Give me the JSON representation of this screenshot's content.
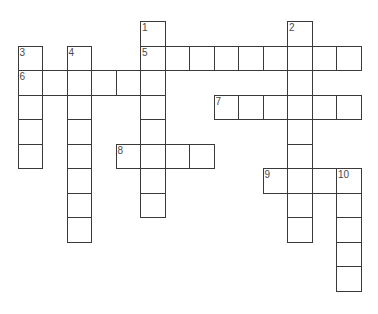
{
  "puzzle": {
    "type": "crossword",
    "grid": {
      "origin_x": 18,
      "origin_y": 21.5,
      "cell_size": 24.5,
      "line_color": "#3a3a3a",
      "number_color": "#4a4a4a"
    },
    "entries": [
      {
        "number": "1",
        "direction": "down",
        "row": 0,
        "col": 5,
        "length": 8
      },
      {
        "number": "2",
        "direction": "down",
        "row": 0,
        "col": 11,
        "length": 9
      },
      {
        "number": "3",
        "direction": "down",
        "row": 1,
        "col": 0,
        "length": 5
      },
      {
        "number": "4",
        "direction": "down",
        "row": 1,
        "col": 2,
        "length": 8
      },
      {
        "number": "5",
        "direction": "across",
        "row": 1,
        "col": 5,
        "length": 9
      },
      {
        "number": "6",
        "direction": "across",
        "row": 2,
        "col": 0,
        "length": 6
      },
      {
        "number": "7",
        "direction": "across",
        "row": 3,
        "col": 8,
        "length": 6
      },
      {
        "number": "8",
        "direction": "across",
        "row": 5,
        "col": 4,
        "length": 4
      },
      {
        "number": "9",
        "direction": "across",
        "row": 6,
        "col": 10,
        "length": 4
      },
      {
        "number": "10",
        "direction": "down",
        "row": 6,
        "col": 13,
        "length": 5
      }
    ]
  }
}
